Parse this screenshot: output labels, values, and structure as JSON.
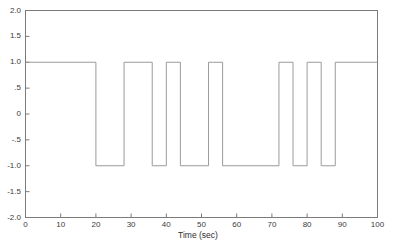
{
  "chart_data": {
    "type": "line",
    "title": "",
    "subtitle": "",
    "xlabel": "Time (sec)",
    "ylabel": "",
    "xlim": [
      0,
      100
    ],
    "ylim": [
      -2.0,
      2.0
    ],
    "grid": false,
    "legend": null,
    "line_color": "#9a9a9a",
    "axis_color": "#7b7b7b",
    "text_color": "#3a3a3a",
    "background": "#ffffff",
    "xticks": [
      0,
      10,
      20,
      30,
      40,
      50,
      60,
      70,
      80,
      90,
      100
    ],
    "xtick_labels": [
      "0",
      "10",
      "20",
      "30",
      "40",
      "50",
      "60",
      "70",
      "80",
      "90",
      "100"
    ],
    "yticks": [
      2.0,
      1.5,
      1.0,
      0.5,
      0,
      -0.5,
      -1.0,
      -1.5,
      -2.0
    ],
    "ytick_labels": [
      "2.0",
      "1.5",
      "1.0",
      ".5",
      "0",
      "-.5",
      "-1.0",
      "-1.5",
      "-2.0"
    ],
    "series": [
      {
        "name": "signal",
        "style": "step",
        "high_level": 1.0,
        "low_level": -1.0,
        "bit_period": 4,
        "transitions": [
          20,
          28,
          36,
          40,
          44,
          52,
          56,
          72,
          76,
          80,
          84,
          88
        ],
        "x": [
          0,
          20,
          20,
          28,
          28,
          36,
          36,
          40,
          40,
          44,
          44,
          52,
          52,
          56,
          56,
          72,
          72,
          76,
          76,
          80,
          80,
          84,
          84,
          88,
          88,
          100
        ],
        "y": [
          1,
          1,
          -1,
          -1,
          1,
          1,
          -1,
          -1,
          1,
          1,
          -1,
          -1,
          1,
          1,
          -1,
          -1,
          1,
          1,
          -1,
          -1,
          1,
          1,
          -1,
          -1,
          1,
          1
        ]
      }
    ]
  }
}
